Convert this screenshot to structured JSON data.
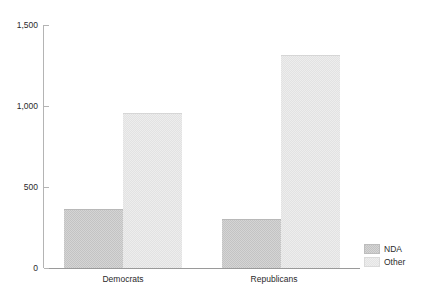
{
  "chart_data": {
    "type": "bar",
    "title": "",
    "subtitle": "",
    "xlabel": "",
    "ylabel": "",
    "categories": [
      "Democrats",
      "Republicans"
    ],
    "series": [
      {
        "name": "NDA",
        "values": [
          360,
          295
        ],
        "color": "#c3c3c3"
      },
      {
        "name": "Other",
        "values": [
          950,
          1310
        ],
        "color": "#e2e2e2"
      }
    ],
    "ylim": [
      0,
      1500
    ],
    "yticks": [
      0,
      500,
      1000,
      1500
    ],
    "ytick_labels": [
      "0",
      "500",
      "1,000",
      "1,500"
    ],
    "grid": false,
    "legend_position": "bottom-right-outside",
    "bar_mode": "grouped",
    "bar_gap": 0
  },
  "axis": {
    "y": {
      "ticks": [
        {
          "label": "1,500",
          "value": 1500
        },
        {
          "label": "1,000",
          "value": 1000
        },
        {
          "label": "500",
          "value": 500
        },
        {
          "label": "0",
          "value": 0
        }
      ]
    },
    "x": {
      "categories": [
        {
          "label": "Democrats"
        },
        {
          "label": "Republicans"
        }
      ]
    }
  },
  "legend": {
    "items": [
      {
        "label": "NDA"
      },
      {
        "label": "Other"
      }
    ]
  }
}
